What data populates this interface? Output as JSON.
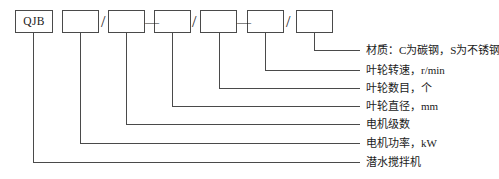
{
  "diagram": {
    "type": "model-designation-breakdown",
    "line_color": "#4a4a4a",
    "text_color": "#1a1a1a",
    "background_color": "#ffffff",
    "boxes": [
      {
        "id": "box-prefix",
        "label": "QJB",
        "value": "QJB",
        "x": 15,
        "y": 10,
        "width": 38,
        "height": 23,
        "filled": true
      },
      {
        "id": "box-2",
        "label": "",
        "value": "",
        "x": 62,
        "y": 10,
        "width": 37,
        "height": 23,
        "filled": false
      },
      {
        "id": "box-3",
        "label": "",
        "value": "",
        "x": 108,
        "y": 10,
        "width": 37,
        "height": 23,
        "filled": false
      },
      {
        "id": "box-4",
        "label": "",
        "value": "",
        "x": 154,
        "y": 10,
        "width": 37,
        "height": 23,
        "filled": false
      },
      {
        "id": "box-5",
        "label": "",
        "value": "",
        "x": 200,
        "y": 10,
        "width": 37,
        "height": 23,
        "filled": false
      },
      {
        "id": "box-6",
        "label": "",
        "value": "",
        "x": 247,
        "y": 10,
        "width": 37,
        "height": 23,
        "filled": false
      },
      {
        "id": "box-7",
        "label": "",
        "value": "",
        "x": 296,
        "y": 10,
        "width": 37,
        "height": 23,
        "filled": false
      }
    ],
    "separators": [
      {
        "id": "sep-1",
        "symbol": "/",
        "x": 101,
        "y": 14
      },
      {
        "id": "sep-2",
        "symbol": "—",
        "x": 145,
        "y": 16
      },
      {
        "id": "sep-3",
        "symbol": "/",
        "x": 192,
        "y": 14
      },
      {
        "id": "sep-4",
        "symbol": "—",
        "x": 237,
        "y": 16
      },
      {
        "id": "sep-5",
        "symbol": "/",
        "x": 286,
        "y": 14
      }
    ],
    "leaders": [
      {
        "id": "leader-material",
        "from_box": "box-7",
        "drop_x": 314,
        "line_y": 50,
        "label_x": 366,
        "label_y": 45,
        "text": "材质：C为碳钢，S为不锈钢"
      },
      {
        "id": "leader-impeller-speed",
        "from_box": "box-6",
        "drop_x": 265,
        "line_y": 70,
        "label_x": 366,
        "label_y": 65,
        "text": "叶轮转速，r/min"
      },
      {
        "id": "leader-impeller-count",
        "from_box": "box-5",
        "drop_x": 219,
        "line_y": 88,
        "label_x": 366,
        "label_y": 83,
        "text": "叶轮数目，个"
      },
      {
        "id": "leader-impeller-diam",
        "from_box": "box-4",
        "drop_x": 172,
        "line_y": 106,
        "label_x": 366,
        "label_y": 101,
        "text": "叶轮直径，mm"
      },
      {
        "id": "leader-motor-poles",
        "from_box": "box-3",
        "drop_x": 126,
        "line_y": 124,
        "label_x": 366,
        "label_y": 119,
        "text": "电机级数"
      },
      {
        "id": "leader-motor-power",
        "from_box": "box-2",
        "drop_x": 80,
        "line_y": 143,
        "label_x": 366,
        "label_y": 138,
        "text": "电机功率，kW"
      },
      {
        "id": "leader-product-name",
        "from_box": "box-prefix",
        "drop_x": 33,
        "line_y": 162,
        "label_x": 366,
        "label_y": 157,
        "text": "潜水搅拌机"
      }
    ],
    "leader_line_end_x": 360
  }
}
